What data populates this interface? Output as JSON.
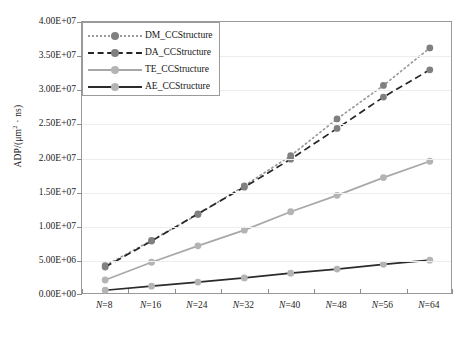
{
  "chart_data": {
    "type": "line",
    "title": "",
    "xlabel": "",
    "ylabel": "ADP/(μm² · ns)",
    "categories": [
      "N=8",
      "N=16",
      "N=24",
      "N=32",
      "N=40",
      "N=48",
      "N=56",
      "N=64"
    ],
    "x_tick_labels": [
      "N=8",
      "N=16",
      "N=24",
      "N=32",
      "N=40",
      "N=48",
      "N=56",
      "N=64"
    ],
    "y_tick_labels": [
      "0.00E+00",
      "5.00E+06",
      "1.00E+07",
      "1.50E+07",
      "2.00E+07",
      "2.50E+07",
      "3.00E+07",
      "3.50E+07",
      "4.00E+07"
    ],
    "y_tick_values": [
      0,
      5000000,
      10000000,
      15000000,
      20000000,
      25000000,
      30000000,
      35000000,
      40000000
    ],
    "ylim": [
      0,
      40000000
    ],
    "grid": true,
    "legend_position": "top-left",
    "series": [
      {
        "name": "DM_CCStructure",
        "style": "dotted",
        "color": "#9a9a9a",
        "marker_color": "#808080",
        "values": [
          4300000,
          8000000,
          11800000,
          16000000,
          20400000,
          25800000,
          30700000,
          36200000
        ]
      },
      {
        "name": "DA_CCStructure",
        "style": "dashed",
        "color": "#262626",
        "marker_color": "#808080",
        "values": [
          4100000,
          7900000,
          11900000,
          15800000,
          19900000,
          24400000,
          29000000,
          33000000
        ]
      },
      {
        "name": "TE_CCStructure",
        "style": "solid",
        "color": "#a8a8a8",
        "marker_color": "#b4b4b4",
        "values": [
          2200000,
          4800000,
          7200000,
          9500000,
          12200000,
          14600000,
          17200000,
          19600000
        ]
      },
      {
        "name": "AE_CCStructure",
        "style": "solid",
        "color": "#2b2b2b",
        "marker_color": "#b4b4b4",
        "values": [
          700000,
          1300000,
          1900000,
          2500000,
          3200000,
          3800000,
          4500000,
          5100000
        ]
      }
    ]
  },
  "legend": {
    "items": [
      {
        "label": "DM_CCStructure"
      },
      {
        "label": "DA_CCStructure"
      },
      {
        "label": "TE_CCStructure"
      },
      {
        "label": "AE_CCStructure"
      }
    ]
  },
  "axis": {
    "y_title_prefix": "ADP/(",
    "y_title_mu": "μm",
    "y_title_sup": "2",
    "y_title_suffix": " · ns)"
  }
}
